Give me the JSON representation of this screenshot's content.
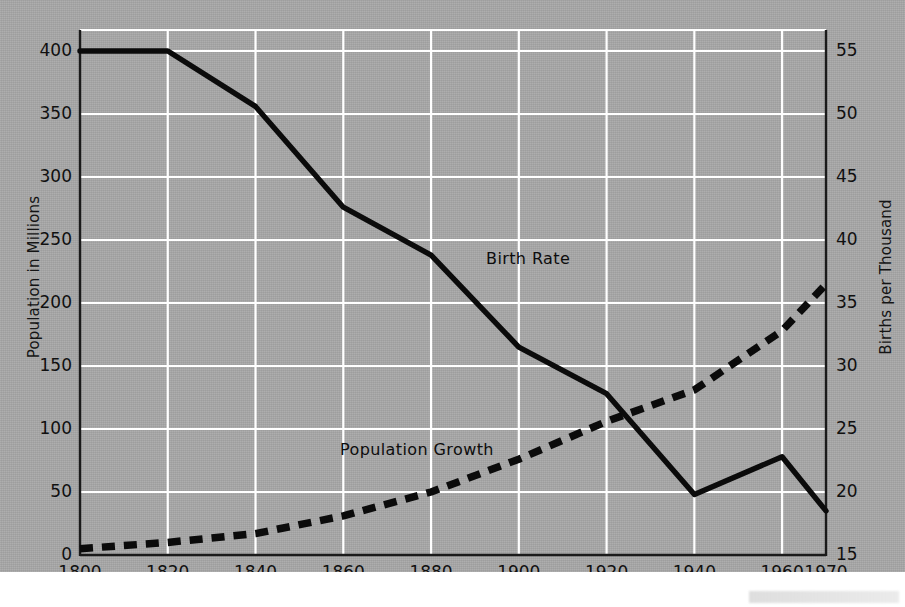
{
  "figure": {
    "background_color": "#a8a8a8",
    "ink_color": "#111111",
    "grid_color": "#ffffff"
  },
  "axes": {
    "left_title": "Population in Millions",
    "right_title": "Births per Thousand",
    "left_ticks": [
      "0",
      "50",
      "100",
      "150",
      "200",
      "250",
      "300",
      "350",
      "400"
    ],
    "right_ticks": [
      "15",
      "20",
      "25",
      "30",
      "35",
      "40",
      "45",
      "50",
      "55"
    ],
    "x_ticks": [
      "1800",
      "1820",
      "1840",
      "1860",
      "1880",
      "1900",
      "1920",
      "1940",
      "1960",
      "1970"
    ]
  },
  "series_labels": {
    "birth_rate": "Birth Rate",
    "population_growth": "Population Growth"
  },
  "chart_data": {
    "type": "line",
    "title": "",
    "xlabel": "",
    "ylabel": "Population in Millions",
    "y2label": "Births per Thousand",
    "xlim": [
      1800,
      1970
    ],
    "ylim": [
      0,
      400
    ],
    "y2lim": [
      15,
      55
    ],
    "grid": true,
    "legend": "inline-annotations",
    "x": [
      1800,
      1820,
      1840,
      1860,
      1880,
      1900,
      1920,
      1940,
      1960,
      1970
    ],
    "series": [
      {
        "name": "Population Growth",
        "axis": "left",
        "units": "millions",
        "style": "dashed",
        "values": [
          5,
          10,
          17,
          31,
          50,
          76,
          106,
          131,
          178,
          215
        ]
      },
      {
        "name": "Birth Rate",
        "axis": "right",
        "units": "births per thousand",
        "style": "solid",
        "values": [
          55.0,
          55.0,
          50.6,
          42.6,
          38.8,
          31.5,
          27.8,
          19.8,
          22.8,
          18.5
        ]
      }
    ],
    "annotations": [
      {
        "text": "Birth Rate",
        "x": 1893,
        "y_axis": "right",
        "y": 38.0
      },
      {
        "text": "Population Growth",
        "x": 1862,
        "y_axis": "left",
        "y": 92
      }
    ]
  }
}
